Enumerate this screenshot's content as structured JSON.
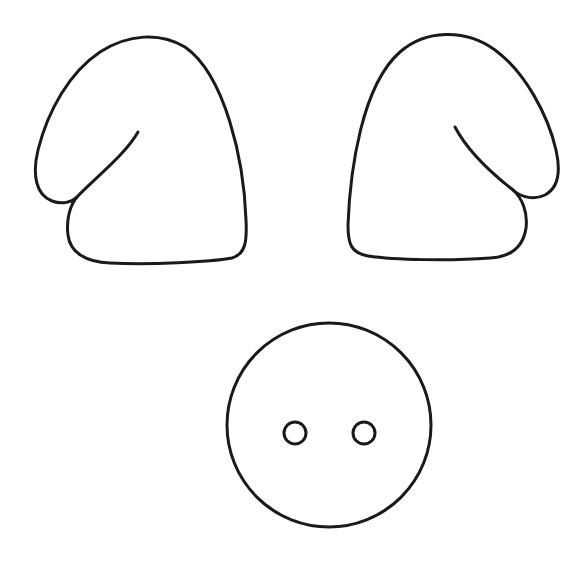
{
  "canvas": {
    "width": 588,
    "height": 565,
    "background": "#ffffff"
  },
  "colors": {
    "stroke": "#1a1a1a",
    "fill": "#ffffff"
  },
  "template": {
    "pieces": [
      {
        "name": "left-ear"
      },
      {
        "name": "right-ear"
      },
      {
        "name": "snout",
        "nostrils": 2
      }
    ]
  }
}
